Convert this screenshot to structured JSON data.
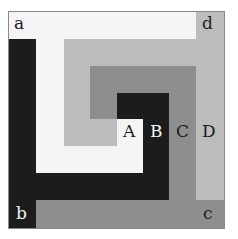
{
  "colors": {
    "white": "#f4f4f4",
    "light_gray": "#bdbdbd",
    "mid_gray": "#8e8e8e",
    "dark": "#1c1c1c"
  },
  "corner_labels": {
    "a": "a",
    "b": "b",
    "c": "c",
    "d": "d"
  },
  "band_labels": {
    "A": "A",
    "B": "B",
    "C": "C",
    "D": "D"
  }
}
